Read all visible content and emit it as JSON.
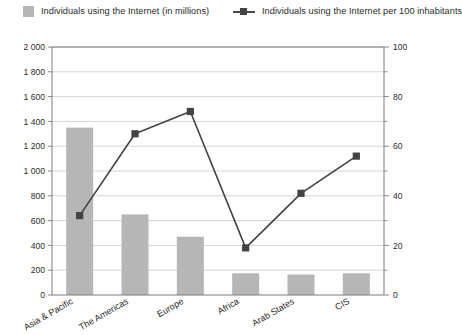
{
  "legend": {
    "bar_label": "Individuals using the Internet (in millions)",
    "line_label": "Individuals using the Internet per 100 inhabitants"
  },
  "colors": {
    "bar": "#b6b6b6",
    "line": "#434343",
    "grid": "#c9c9c9",
    "axis": "#7a7a7a",
    "text": "#2b2b2b"
  },
  "axes": {
    "left_ticks": [
      "0",
      "200",
      "400",
      "600",
      "800",
      "1 000",
      "1 200",
      "1 400",
      "1 600",
      "1 800",
      "2 000"
    ],
    "right_ticks": [
      "0",
      "20",
      "40",
      "60",
      "80",
      "100"
    ]
  },
  "chart_data": {
    "type": "bar",
    "title": "",
    "subtitle": "",
    "xlabel": "",
    "ylabel": "",
    "y2label": "",
    "grid": true,
    "legend_position": "top",
    "categories": [
      "Asia & Pacific",
      "The Americas",
      "Europe",
      "Africa",
      "Arab States",
      "CIS"
    ],
    "series": [
      {
        "name": "Individuals using the Internet (in millions)",
        "type": "bar",
        "axis": "left",
        "values": [
          1350,
          650,
          470,
          175,
          165,
          175
        ],
        "color": "#b6b6b6"
      },
      {
        "name": "Individuals using the Internet per 100 inhabitants",
        "type": "line",
        "axis": "right",
        "values": [
          32,
          65,
          74,
          19,
          41,
          56
        ],
        "color": "#434343"
      }
    ],
    "ylim": [
      0,
      2000
    ],
    "y2lim": [
      0,
      100
    ],
    "ytick_step": 200,
    "y2tick_step": 20
  }
}
